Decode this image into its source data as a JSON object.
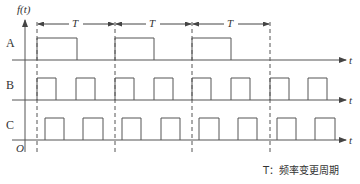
{
  "diagram": {
    "y_axis_label": "f(t)",
    "x_axis_label": "t",
    "origin_label": "O",
    "period_label": "T",
    "rows": [
      {
        "label": "A",
        "baseline_y": 60,
        "high_y": 38,
        "pulses": [
          [
            37,
            77
          ],
          [
            115,
            154
          ],
          [
            192,
            231
          ]
        ]
      },
      {
        "label": "B",
        "baseline_y": 100,
        "high_y": 78,
        "pulses": [
          [
            37,
            56
          ],
          [
            76,
            95
          ],
          [
            115,
            134
          ],
          [
            154,
            173
          ],
          [
            192,
            211
          ],
          [
            231,
            250
          ],
          [
            270,
            289
          ],
          [
            308,
            327
          ]
        ]
      },
      {
        "label": "C",
        "baseline_y": 140,
        "high_y": 118,
        "pulses": [
          [
            45,
            64
          ],
          [
            83,
            103
          ],
          [
            122,
            141
          ],
          [
            161,
            180
          ],
          [
            199,
            219
          ],
          [
            238,
            257
          ],
          [
            277,
            296
          ],
          [
            315,
            335
          ]
        ]
      }
    ],
    "period_markers_x": [
      37,
      115,
      192,
      270
    ],
    "legend": "T：频率变更周期",
    "line_color": "#555555"
  }
}
